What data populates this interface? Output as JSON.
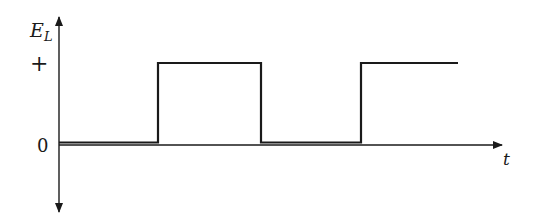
{
  "diagram": {
    "type": "square-wave",
    "y_axis_label_main": "E",
    "y_axis_label_sub": "L",
    "x_axis_label": "t",
    "level_high_label": "+",
    "level_zero_label": "0",
    "colors": {
      "line": "#1a1a1a",
      "background": "#ffffff"
    },
    "waveform": {
      "segments": [
        {
          "level": "0",
          "t_start": 0,
          "t_end": 1
        },
        {
          "level": "+",
          "t_start": 1,
          "t_end": 2
        },
        {
          "level": "0",
          "t_start": 2,
          "t_end": 3
        },
        {
          "level": "+",
          "t_start": 3,
          "t_end": 4
        }
      ]
    }
  }
}
